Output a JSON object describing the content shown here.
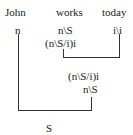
{
  "words": {
    "john": "John",
    "works": "works",
    "today": "today"
  },
  "categories": {
    "john": "n",
    "works": "n\\S",
    "today": "i\\i",
    "works_raised": "(n\\S/i)i"
  },
  "derivation": {
    "combined_step1": "(n\\S/i)i",
    "combined_step2": "n\\S",
    "result": "S"
  }
}
